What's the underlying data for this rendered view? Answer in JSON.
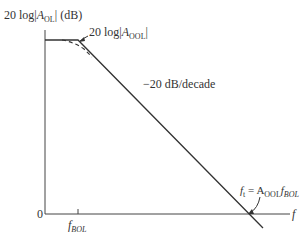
{
  "diagram": {
    "type": "bode-magnitude-plot",
    "y_axis_label": {
      "prefix": "20 log|",
      "var": "A",
      "sub": "OL",
      "suffix": "| (dB)"
    },
    "x_axis_label": "f",
    "origin_label": "0",
    "corner_label": {
      "prefix": "20 log|",
      "var": "A",
      "sub": "OOL",
      "suffix": "|"
    },
    "slope_label": "−20 dB/decade",
    "corner_freq_label": {
      "var": "f",
      "sub": "BOL"
    },
    "unity_label": {
      "lhs": "f",
      "lhs_sub": "t",
      "eq": " = A",
      "a_sub": "OOL",
      "f": "f",
      "f_sub": "BOL"
    },
    "colors": {
      "line": "#333333"
    }
  }
}
